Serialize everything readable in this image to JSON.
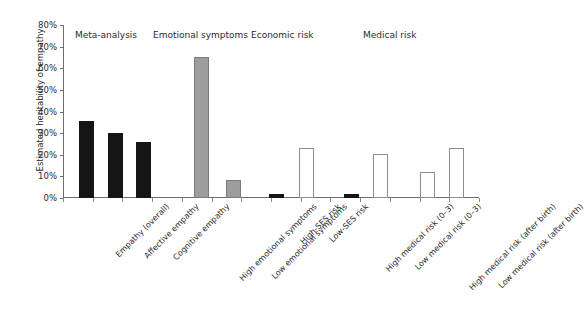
{
  "chart_data": {
    "type": "bar",
    "title": "",
    "xlabel": "",
    "ylabel": "Estimated heritability of empathy",
    "ylim": [
      0,
      80
    ],
    "ytick_labels": [
      "0%",
      "10%",
      "20%",
      "30%",
      "40%",
      "50%",
      "60%",
      "70%",
      "80%"
    ],
    "ytick_values": [
      0,
      10,
      20,
      30,
      40,
      50,
      60,
      70,
      80
    ],
    "grid": false,
    "legend": "none",
    "categories": [
      "Empathy (overall)",
      "Affective empathy",
      "Cognitive empathy",
      "High emotional symptoms",
      "Low emotional symptoms",
      "High-SES risk",
      "Low-SES risk",
      "High medical risk (0–3)",
      "Low medical risk (0–3)",
      "High medical risk (after birth)",
      "Low medical risk (after birth)"
    ],
    "values": [
      35.5,
      30,
      26,
      65,
      8.5,
      2,
      23,
      2,
      20.5,
      12,
      23
    ],
    "bar_styles": [
      "black",
      "black",
      "black",
      "gray",
      "gray",
      "black",
      "white",
      "black",
      "white",
      "white",
      "white"
    ],
    "groups": [
      {
        "label": "Meta-analysis",
        "members": [
          "Empathy (overall)",
          "Affective empathy",
          "Cognitive empathy"
        ]
      },
      {
        "label": "Emotional symptoms",
        "members": [
          "High emotional symptoms",
          "Low emotional symptoms"
        ]
      },
      {
        "label": "Economic risk",
        "members": [
          "High-SES risk",
          "Low-SES risk"
        ]
      },
      {
        "label": "Medical risk",
        "members": [
          "High medical risk (0–3)",
          "Low medical risk (0–3)",
          "High medical risk (after birth)",
          "Low medical risk (after birth)"
        ]
      }
    ],
    "colors": {
      "black_bar": "#151515",
      "gray_bar": "#9d9d9d",
      "white_bar": "#ffffff",
      "outline": "#8e8e8e",
      "axis": "#6e6e6e",
      "text": "#2b2b2b"
    }
  }
}
